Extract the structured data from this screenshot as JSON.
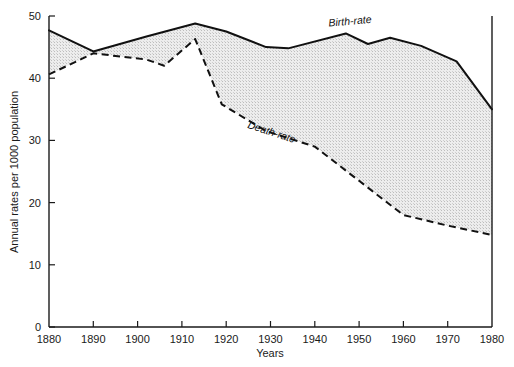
{
  "chart_data": {
    "type": "line",
    "title": "",
    "xlabel": "Years",
    "ylabel": "Annual rates per 1000 population",
    "xlim": [
      1880,
      1980
    ],
    "ylim": [
      0,
      50
    ],
    "xticks": [
      1880,
      1890,
      1900,
      1910,
      1920,
      1930,
      1940,
      1950,
      1960,
      1970,
      1980
    ],
    "yticks": [
      0,
      10,
      20,
      30,
      40,
      50
    ],
    "grid": false,
    "legend_position": "inline-annotation",
    "fill_between": {
      "series": [
        "Birth-rate",
        "Death-rate"
      ],
      "color": "#e9e9e9",
      "pattern": "stipple"
    },
    "series": [
      {
        "name": "Birth-rate",
        "style": "solid",
        "color": "#111111",
        "x": [
          1880,
          1890,
          1902,
          1913,
          1920,
          1929,
          1934,
          1947,
          1952,
          1957,
          1964,
          1972,
          1980
        ],
        "values": [
          47.7,
          44.3,
          46.7,
          48.8,
          47.5,
          45.0,
          44.8,
          47.2,
          45.5,
          46.5,
          45.2,
          42.7,
          35.0
        ]
      },
      {
        "name": "Death-rate",
        "style": "dashed",
        "color": "#111111",
        "x": [
          1880,
          1890,
          1902,
          1906,
          1913,
          1919,
          1929,
          1940,
          1950,
          1960,
          1970,
          1980
        ],
        "values": [
          40.6,
          44.0,
          43.0,
          42.0,
          46.3,
          35.8,
          31.5,
          29.0,
          23.5,
          18.0,
          16.3,
          14.8
        ]
      }
    ],
    "annotations": [
      {
        "text": "Birth-rate",
        "x": 1948,
        "y": 48.6
      },
      {
        "text": "Death-rate",
        "x": 1930,
        "y": 30.8
      }
    ]
  },
  "axes": {
    "y_tick_labels": [
      "0",
      "10",
      "20",
      "30",
      "40",
      "50"
    ],
    "x_tick_labels": [
      "1880",
      "1890",
      "1900",
      "1910",
      "1920",
      "1930",
      "1940",
      "1950",
      "1960",
      "1970",
      "1980"
    ],
    "x_axis_title": "Years",
    "y_axis_title": "Annual rates per 1000 population"
  },
  "labels": {
    "birth_rate": "Birth-rate",
    "death_rate": "Death-rate"
  },
  "colors": {
    "line": "#111111",
    "fill": "#e9e9e9",
    "axis": "#1a1a1a",
    "background": "#ffffff"
  }
}
